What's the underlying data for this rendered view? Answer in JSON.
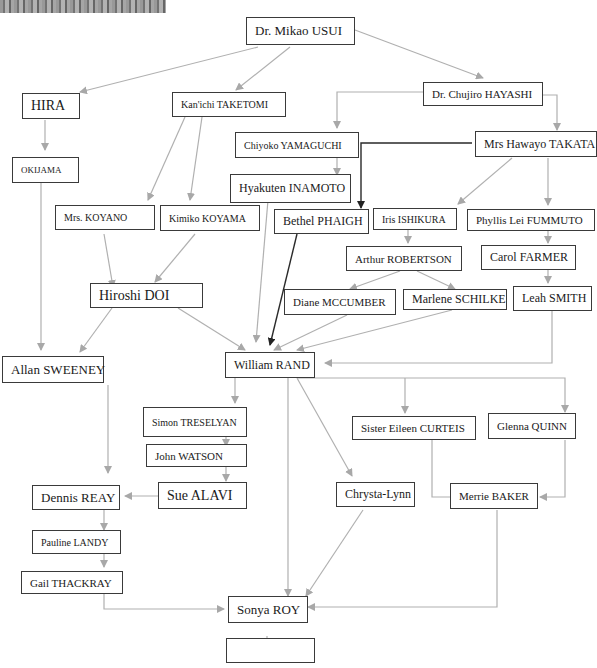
{
  "diagram": {
    "type": "lineage-tree",
    "colors": {
      "edge": "#b0b0b0",
      "edge_dark": "#2a2a2a",
      "box_border": "#3a3a3a"
    },
    "nodes": {
      "usui": "Dr. Mikao USUI",
      "hira": "HIRA",
      "taketomi": "Kan'ichi TAKETOMI",
      "hayashi": "Dr. Chujiro HAYASHI",
      "okijama": "OKIJAMA",
      "yamaguchi": "Chiyoko YAMAGUCHI",
      "takata": "Mrs Hawayo TAKATA",
      "inamoto": "Hyakuten INAMOTO",
      "koyano": "Mrs. KOYANO",
      "koyama": "Kimiko KOYAMA",
      "phaigh": "Bethel PHAIGH",
      "ishikura": "Iris ISHIKURA",
      "fummuto": "Phyllis Lei FUMMUTO",
      "robertson": "Arthur ROBERTSON",
      "farmer": "Carol FARMER",
      "doi": "Hiroshi DOI",
      "mccumber": "Diane MCCUMBER",
      "schilke": "Marlene SCHILKE",
      "smith": "Leah SMITH",
      "sweeney": "Allan SWEENEY",
      "rand": "William RAND",
      "treselyan": "Simon TRESELYAN",
      "curteis": "Sister Eileen CURTEIS",
      "quinn": "Glenna QUINN",
      "watson": "John WATSON",
      "reay": "Dennis REAY",
      "alavi": "Sue ALAVI",
      "chrysta": "Chrysta-Lynn",
      "baker": "Merrie BAKER",
      "landy": "Pauline LANDY",
      "thackray": "Gail THACKRAY",
      "roy": "Sonya ROY",
      "empty": ""
    },
    "edges": [
      [
        "usui",
        "hira"
      ],
      [
        "usui",
        "taketomi"
      ],
      [
        "usui",
        "hayashi"
      ],
      [
        "hira",
        "okijama"
      ],
      [
        "okijama",
        "sweeney"
      ],
      [
        "taketomi",
        "koyano"
      ],
      [
        "taketomi",
        "koyama"
      ],
      [
        "hayashi",
        "yamaguchi"
      ],
      [
        "hayashi",
        "takata"
      ],
      [
        "yamaguchi",
        "inamoto"
      ],
      [
        "takata",
        "phaigh"
      ],
      [
        "takata",
        "ishikura"
      ],
      [
        "takata",
        "fummuto"
      ],
      [
        "ishikura",
        "robertson"
      ],
      [
        "robertson",
        "mccumber"
      ],
      [
        "robertson",
        "schilke"
      ],
      [
        "fummuto",
        "farmer"
      ],
      [
        "farmer",
        "smith"
      ],
      [
        "koyano",
        "doi"
      ],
      [
        "koyama",
        "doi"
      ],
      [
        "doi",
        "sweeney"
      ],
      [
        "doi",
        "rand"
      ],
      [
        "inamoto",
        "rand"
      ],
      [
        "phaigh",
        "rand"
      ],
      [
        "mccumber",
        "rand"
      ],
      [
        "schilke",
        "rand"
      ],
      [
        "smith",
        "rand"
      ],
      [
        "rand",
        "treselyan"
      ],
      [
        "rand",
        "curteis"
      ],
      [
        "rand",
        "quinn"
      ],
      [
        "rand",
        "chrysta"
      ],
      [
        "rand",
        "roy"
      ],
      [
        "treselyan",
        "watson"
      ],
      [
        "watson",
        "alavi"
      ],
      [
        "alavi",
        "reay"
      ],
      [
        "sweeney",
        "reay"
      ],
      [
        "reay",
        "landy"
      ],
      [
        "landy",
        "thackray"
      ],
      [
        "thackray",
        "roy"
      ],
      [
        "curteis",
        "baker"
      ],
      [
        "quinn",
        "baker"
      ],
      [
        "chrysta",
        "roy"
      ],
      [
        "baker",
        "roy"
      ],
      [
        "roy",
        "empty"
      ]
    ]
  }
}
